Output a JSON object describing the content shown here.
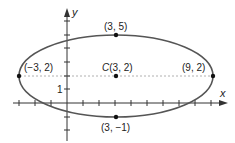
{
  "diagram": {
    "type": "ellipse-graph",
    "axes": {
      "x_label": "x",
      "y_label": "y",
      "y_tick_label": "1"
    },
    "center": {
      "label_prefix": "C",
      "label_coords": "(3, 2)",
      "x": 3,
      "y": 2
    },
    "points": [
      {
        "name": "top-vertex",
        "label": "(3, 5)",
        "x": 3,
        "y": 5
      },
      {
        "name": "bottom-vertex",
        "label": "(3, −1)",
        "x": 3,
        "y": -1
      },
      {
        "name": "left-vertex",
        "label": "(−3, 2)",
        "x": -3,
        "y": 2
      },
      {
        "name": "right-vertex",
        "label": "(9, 2)",
        "x": 9,
        "y": 2
      }
    ],
    "colors": {
      "curve": "#555555",
      "axis": "#333333",
      "dashed": "#aaaaaa",
      "point": "#111111"
    }
  }
}
